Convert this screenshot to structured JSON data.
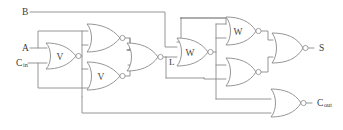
{
  "diagram": {
    "kind": "logic-circuit-schematic",
    "colors": {
      "background": "#ffffff",
      "wire": "#8a8a8a",
      "gate_outline": "#8a8a8a",
      "text": "#3a3a3a",
      "gate_label_text": "#4a4a4a"
    },
    "inputs": [
      {
        "id": "in-b",
        "label": "B",
        "subscript": "",
        "x": 22,
        "y": 12
      },
      {
        "id": "in-a",
        "label": "A",
        "subscript": "",
        "x": 22,
        "y": 48
      },
      {
        "id": "in-cin",
        "label": "C",
        "subscript": "in",
        "x": 16,
        "y": 63
      }
    ],
    "outputs": [
      {
        "id": "out-s",
        "label": "S",
        "subscript": "",
        "x": 319,
        "y": 48
      },
      {
        "id": "out-cout",
        "label": "C",
        "subscript": "out",
        "x": 317,
        "y": 103
      }
    ],
    "signals": [
      {
        "id": "sig-l",
        "label": "L",
        "x": 169,
        "y": 62
      }
    ],
    "gates": [
      {
        "id": "gate-nor-v1",
        "type": "nor",
        "label": "V",
        "cx": 61,
        "cy": 56,
        "w": 30,
        "h": 26
      },
      {
        "id": "gate-nor-u1",
        "type": "nor",
        "label": "",
        "cx": 103,
        "cy": 38,
        "w": 32,
        "h": 28
      },
      {
        "id": "gate-nor-v2",
        "type": "nor",
        "label": "V",
        "cx": 103,
        "cy": 76,
        "w": 32,
        "h": 28
      },
      {
        "id": "gate-nor-l",
        "type": "nor",
        "label": "",
        "cx": 142,
        "cy": 57,
        "w": 30,
        "h": 28
      },
      {
        "id": "gate-nor-w1",
        "type": "nor",
        "label": "W",
        "cx": 192,
        "cy": 52,
        "w": 30,
        "h": 28
      },
      {
        "id": "gate-nor-w2",
        "type": "nor",
        "label": "W",
        "cx": 240,
        "cy": 31,
        "w": 30,
        "h": 28
      },
      {
        "id": "gate-nor-b1",
        "type": "nor",
        "label": "",
        "cx": 240,
        "cy": 72,
        "w": 30,
        "h": 28
      },
      {
        "id": "gate-nor-s",
        "type": "nor",
        "label": "",
        "cx": 287,
        "cy": 48,
        "w": 30,
        "h": 30
      },
      {
        "id": "gate-nor-c",
        "type": "nor",
        "label": "",
        "cx": 285,
        "cy": 103,
        "w": 30,
        "h": 28
      }
    ]
  }
}
